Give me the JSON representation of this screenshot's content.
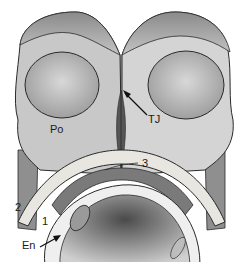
{
  "diagram": {
    "labels": {
      "po": "Po",
      "tj": "TJ",
      "one": "1",
      "two": "2",
      "three": "3",
      "en": "En"
    },
    "colors": {
      "cell_fill": "#b4b4b4",
      "cell_face": "#cfcfcf",
      "nucleus": "#a8a8a8",
      "band": "#e8e6e0",
      "outline": "#2a2a2a",
      "dark": "#555555"
    }
  }
}
